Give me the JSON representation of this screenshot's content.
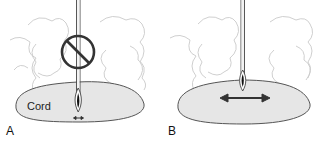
{
  "figure": {
    "panels": [
      {
        "id": "A",
        "letter": "A",
        "structure_label": "Cord",
        "needle": "central-approach",
        "prohibited": true,
        "movement_arrow": "small"
      },
      {
        "id": "B",
        "letter": "B",
        "structure_label": "",
        "needle": "surface-contact",
        "prohibited": false,
        "movement_arrow": "large-bidirectional"
      }
    ],
    "caption_partial": ""
  },
  "colors": {
    "cord_fill": "#e6e6e6",
    "cord_stroke": "#555555",
    "tissue_stroke": "#c8c8c8",
    "needle_stroke": "#444444",
    "prohibit_stroke": "#333333",
    "arrow": "#333333"
  }
}
